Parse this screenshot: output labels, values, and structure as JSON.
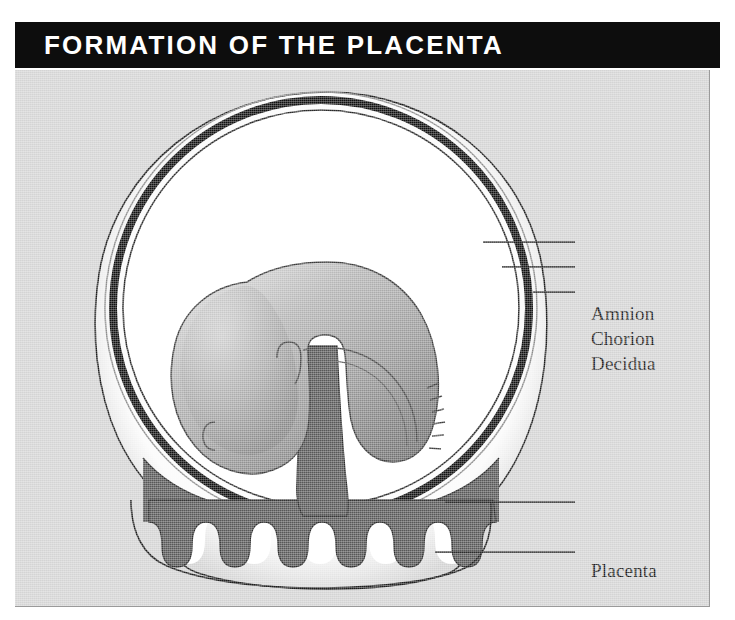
{
  "header": {
    "title": "FORMATION OF THE PLACENTA"
  },
  "figure": {
    "labels": [
      {
        "key": "amnion",
        "text": "Amnion"
      },
      {
        "key": "chorion",
        "text": "Chorion"
      },
      {
        "key": "decidua",
        "text": "Decidua"
      },
      {
        "key": "placenta",
        "text": "Placenta"
      },
      {
        "key": "placental_bed",
        "text": "Placental bed"
      }
    ],
    "structures": [
      "decidua-outer-ring",
      "chorion-ring",
      "amnion-ring",
      "amniotic-cavity",
      "embryo",
      "umbilical-cord",
      "placenta-mass",
      "chorionic-villi",
      "placental-bed"
    ],
    "villi_count": 10
  },
  "colors": {
    "title_bar": "#0d0d0d",
    "title_text": "#ffffff",
    "page_background": "#ffffff",
    "figure_background": "#d4d4d4",
    "chorion_black": "#111111",
    "decidua_white": "#fcfcfc",
    "embryo_gray": "#9b9b9b",
    "embryo_shadow": "#6e6e6e",
    "cord_gray": "#585858",
    "placenta_gray": "#585858",
    "outline": "#1c1c1c",
    "label_text": "#1c1c1c"
  }
}
